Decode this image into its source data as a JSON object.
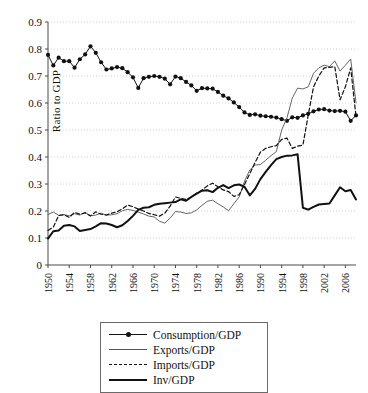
{
  "chart_data": {
    "type": "line",
    "title": "",
    "xlabel": "",
    "ylabel": "Ratio to GDP",
    "ylim": [
      0,
      0.9
    ],
    "ytick_labels": [
      "0",
      "0.1",
      "0.2",
      "0.3",
      "0.4",
      "0.5",
      "0.6",
      "0.7",
      "0.8",
      "0.9"
    ],
    "ytick_values": [
      0,
      0.1,
      0.2,
      0.3,
      0.4,
      0.5,
      0.6,
      0.7,
      0.8,
      0.9
    ],
    "xlim": [
      1950,
      2008
    ],
    "xtick_labels": [
      "1950",
      "1954",
      "1958",
      "1962",
      "1966",
      "1970",
      "1974",
      "1978",
      "1982",
      "1986",
      "1990",
      "1994",
      "1998",
      "2002",
      "2006"
    ],
    "xtick_values": [
      1950,
      1954,
      1958,
      1962,
      1966,
      1970,
      1974,
      1978,
      1982,
      1986,
      1990,
      1994,
      1998,
      2002,
      2006
    ],
    "grid": true,
    "grid_style": "dotted-horizontal",
    "legend_position": "below-center",
    "x": [
      1950,
      1951,
      1952,
      1953,
      1954,
      1955,
      1956,
      1957,
      1958,
      1959,
      1960,
      1961,
      1962,
      1963,
      1964,
      1965,
      1966,
      1967,
      1968,
      1969,
      1970,
      1971,
      1972,
      1973,
      1974,
      1975,
      1976,
      1977,
      1978,
      1979,
      1980,
      1981,
      1982,
      1983,
      1984,
      1985,
      1986,
      1987,
      1988,
      1989,
      1990,
      1991,
      1992,
      1993,
      1994,
      1995,
      1996,
      1997,
      1998,
      1999,
      2000,
      2001,
      2002,
      2003,
      2004,
      2005,
      2006,
      2007,
      2008
    ],
    "series": [
      {
        "name": "Consumption/GDP",
        "style": "line-markers",
        "values": [
          0.778,
          0.739,
          0.768,
          0.755,
          0.755,
          0.731,
          0.762,
          0.78,
          0.81,
          0.786,
          0.751,
          0.724,
          0.728,
          0.733,
          0.729,
          0.714,
          0.695,
          0.656,
          0.692,
          0.697,
          0.7,
          0.697,
          0.69,
          0.669,
          0.698,
          0.692,
          0.678,
          0.665,
          0.645,
          0.655,
          0.654,
          0.653,
          0.641,
          0.627,
          0.617,
          0.602,
          0.585,
          0.565,
          0.556,
          0.558,
          0.553,
          0.551,
          0.549,
          0.546,
          0.54,
          0.534,
          0.547,
          0.545,
          0.554,
          0.56,
          0.569,
          0.576,
          0.577,
          0.572,
          0.57,
          0.571,
          0.568,
          0.534,
          0.554
        ]
      },
      {
        "name": "Exports/GDP",
        "style": "thin-line",
        "values": [
          0.187,
          0.196,
          0.184,
          0.187,
          0.182,
          0.19,
          0.185,
          0.195,
          0.182,
          0.185,
          0.192,
          0.185,
          0.186,
          0.19,
          0.201,
          0.206,
          0.202,
          0.196,
          0.189,
          0.181,
          0.178,
          0.162,
          0.155,
          0.174,
          0.198,
          0.196,
          0.191,
          0.193,
          0.204,
          0.221,
          0.236,
          0.24,
          0.227,
          0.215,
          0.201,
          0.227,
          0.252,
          0.31,
          0.352,
          0.37,
          0.372,
          0.388,
          0.405,
          0.42,
          0.5,
          0.545,
          0.618,
          0.655,
          0.652,
          0.66,
          0.71,
          0.73,
          0.74,
          0.735,
          0.756,
          0.718,
          0.74,
          0.763,
          0.6
        ]
      },
      {
        "name": "Imports/GDP",
        "style": "dashed-line",
        "values": [
          0.128,
          0.14,
          0.183,
          0.186,
          0.176,
          0.195,
          0.188,
          0.193,
          0.182,
          0.197,
          0.188,
          0.185,
          0.192,
          0.197,
          0.208,
          0.222,
          0.216,
          0.207,
          0.2,
          0.191,
          0.186,
          0.181,
          0.192,
          0.218,
          0.252,
          0.247,
          0.243,
          0.252,
          0.266,
          0.278,
          0.293,
          0.303,
          0.29,
          0.278,
          0.272,
          0.254,
          0.26,
          0.298,
          0.338,
          0.38,
          0.418,
          0.432,
          0.438,
          0.442,
          0.465,
          0.47,
          0.432,
          0.44,
          0.444,
          0.555,
          0.66,
          0.7,
          0.73,
          0.732,
          0.735,
          0.612,
          0.66,
          0.73,
          0.55
        ]
      },
      {
        "name": "Inv/GDP",
        "style": "thick-line",
        "values": [
          0.098,
          0.125,
          0.128,
          0.145,
          0.148,
          0.143,
          0.126,
          0.13,
          0.133,
          0.143,
          0.155,
          0.154,
          0.148,
          0.14,
          0.147,
          0.163,
          0.182,
          0.204,
          0.212,
          0.214,
          0.223,
          0.227,
          0.229,
          0.231,
          0.233,
          0.243,
          0.238,
          0.252,
          0.264,
          0.275,
          0.277,
          0.27,
          0.286,
          0.296,
          0.285,
          0.295,
          0.298,
          0.29,
          0.258,
          0.282,
          0.318,
          0.345,
          0.37,
          0.392,
          0.4,
          0.405,
          0.406,
          0.41,
          0.212,
          0.205,
          0.215,
          0.224,
          0.226,
          0.228,
          0.258,
          0.288,
          0.273,
          0.278,
          0.243
        ]
      }
    ]
  },
  "legend": {
    "items": [
      {
        "label": "Consumption/GDP",
        "key": "line-markers"
      },
      {
        "label": "Exports/GDP",
        "key": "thin-line"
      },
      {
        "label": "Imports/GDP",
        "key": "dashed-line"
      },
      {
        "label": "Inv/GDP",
        "key": "thick-line"
      }
    ]
  },
  "axis": {
    "ylabel": "Ratio to GDP"
  },
  "colors": {
    "ink": "#111111",
    "thin_line": "#555555",
    "grid": "#c9c9c9",
    "axis": "#4a4a4a",
    "legend_border": "#6a6a6a"
  }
}
